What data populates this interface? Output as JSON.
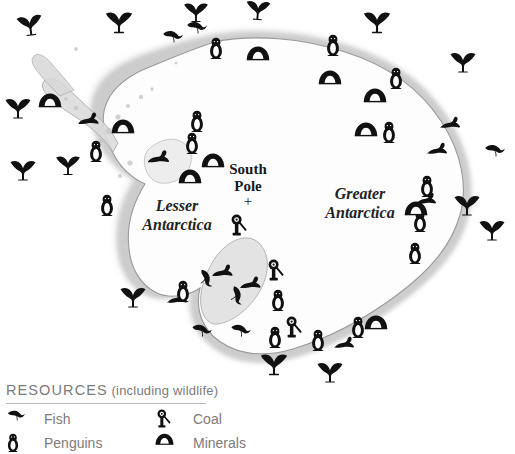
{
  "map": {
    "labels": [
      {
        "name": "lesser-antarctica-label",
        "text": "Lesser\nAntarctica",
        "x": 177,
        "y": 215
      },
      {
        "name": "greater-antarctica-label",
        "text": "Greater\nAntarctica",
        "x": 360,
        "y": 203
      }
    ],
    "south_pole": {
      "label": "South\nPole",
      "marker": "+",
      "x": 248,
      "y": 178,
      "marker_x": 248,
      "marker_y": 201
    },
    "continent_fill": "#fdfdfd",
    "shelf_fill": "#d5d5d5",
    "coast_stroke": "#9a9a9a",
    "icon_color": "#111111"
  },
  "legend": {
    "title_main": "RESOURCES",
    "title_sub": " (including wildlife)",
    "items": [
      {
        "name": "legend-fish",
        "icon": "fish-icon",
        "label": "Fish",
        "x": 6,
        "y": 28
      },
      {
        "name": "legend-penguins",
        "icon": "penguin-icon",
        "label": "Penguins",
        "x": 6,
        "y": 52
      },
      {
        "name": "legend-coal",
        "icon": "coal-icon",
        "label": "Coal",
        "x": 155,
        "y": 28
      },
      {
        "name": "legend-minerals",
        "icon": "minerals-icon",
        "label": "Minerals",
        "x": 155,
        "y": 52
      }
    ]
  },
  "icons": [
    {
      "name": "whale-icon",
      "type": "whale",
      "x": 30,
      "y": 25,
      "s": 1.0,
      "r": -8
    },
    {
      "name": "whale-icon",
      "type": "whale",
      "x": 119,
      "y": 22,
      "s": 1.05,
      "r": 0
    },
    {
      "name": "whale-icon",
      "type": "whale",
      "x": 196,
      "y": 12,
      "s": 0.95,
      "r": 0
    },
    {
      "name": "whale-icon",
      "type": "whale",
      "x": 258,
      "y": 10,
      "s": 0.95,
      "r": 4
    },
    {
      "name": "whale-icon",
      "type": "whale",
      "x": 377,
      "y": 22,
      "s": 1.05,
      "r": 0
    },
    {
      "name": "whale-icon",
      "type": "whale",
      "x": 18,
      "y": 108,
      "s": 1.0,
      "r": 0
    },
    {
      "name": "whale-icon",
      "type": "whale",
      "x": 23,
      "y": 170,
      "s": 1.0,
      "r": 0
    },
    {
      "name": "whale-icon",
      "type": "whale",
      "x": 68,
      "y": 165,
      "s": 0.95,
      "r": 0
    },
    {
      "name": "whale-icon",
      "type": "whale",
      "x": 133,
      "y": 297,
      "s": 1.0,
      "r": 0
    },
    {
      "name": "whale-icon",
      "type": "whale",
      "x": 274,
      "y": 364,
      "s": 1.05,
      "r": 0
    },
    {
      "name": "whale-icon",
      "type": "whale",
      "x": 330,
      "y": 372,
      "s": 1.0,
      "r": 0
    },
    {
      "name": "whale-icon",
      "type": "whale",
      "x": 467,
      "y": 205,
      "s": 1.0,
      "r": 0
    },
    {
      "name": "whale-icon",
      "type": "whale",
      "x": 492,
      "y": 230,
      "s": 1.0,
      "r": 0
    },
    {
      "name": "whale-icon",
      "type": "whale",
      "x": 463,
      "y": 62,
      "s": 1.0,
      "r": 0
    },
    {
      "name": "fish-icon",
      "type": "fish",
      "x": 172,
      "y": 36,
      "s": 1.0,
      "r": 0
    },
    {
      "name": "fish-icon",
      "type": "fish",
      "x": 196,
      "y": 27,
      "s": 1.0,
      "r": 0
    },
    {
      "name": "fish-icon",
      "type": "fish",
      "x": 205,
      "y": 278,
      "s": 1.0,
      "r": 55
    },
    {
      "name": "fish-icon",
      "type": "fish",
      "x": 236,
      "y": 295,
      "s": 1.0,
      "r": 65
    },
    {
      "name": "fish-icon",
      "type": "fish",
      "x": 201,
      "y": 330,
      "s": 1.0,
      "r": 5
    },
    {
      "name": "fish-icon",
      "type": "fish",
      "x": 240,
      "y": 330,
      "s": 1.0,
      "r": 5
    },
    {
      "name": "fish-icon",
      "type": "fish",
      "x": 494,
      "y": 150,
      "s": 1.0,
      "r": 0
    },
    {
      "name": "seal-icon",
      "type": "seal",
      "x": 88,
      "y": 118,
      "s": 1.0,
      "r": 0
    },
    {
      "name": "seal-icon",
      "type": "seal",
      "x": 158,
      "y": 156,
      "s": 1.05,
      "r": 0
    },
    {
      "name": "seal-icon",
      "type": "seal",
      "x": 222,
      "y": 270,
      "s": 1.0,
      "r": 0
    },
    {
      "name": "seal-icon",
      "type": "seal",
      "x": 250,
      "y": 282,
      "s": 1.0,
      "r": 0
    },
    {
      "name": "seal-icon",
      "type": "seal",
      "x": 177,
      "y": 297,
      "s": 0.95,
      "r": 0
    },
    {
      "name": "seal-icon",
      "type": "seal",
      "x": 344,
      "y": 342,
      "s": 0.95,
      "r": 0
    },
    {
      "name": "seal-icon",
      "type": "seal",
      "x": 426,
      "y": 198,
      "s": 0.95,
      "r": 0
    },
    {
      "name": "seal-icon",
      "type": "seal",
      "x": 437,
      "y": 148,
      "s": 0.95,
      "r": 0
    },
    {
      "name": "seal-icon",
      "type": "seal",
      "x": 450,
      "y": 122,
      "s": 0.95,
      "r": 0
    },
    {
      "name": "penguin-icon",
      "type": "penguin",
      "x": 96,
      "y": 151,
      "s": 1.0
    },
    {
      "name": "penguin-icon",
      "type": "penguin",
      "x": 107,
      "y": 205,
      "s": 1.0
    },
    {
      "name": "penguin-icon",
      "type": "penguin",
      "x": 197,
      "y": 121,
      "s": 1.0
    },
    {
      "name": "penguin-icon",
      "type": "penguin",
      "x": 192,
      "y": 143,
      "s": 1.0
    },
    {
      "name": "penguin-icon",
      "type": "penguin",
      "x": 216,
      "y": 48,
      "s": 1.0
    },
    {
      "name": "penguin-icon",
      "type": "penguin",
      "x": 333,
      "y": 45,
      "s": 1.0
    },
    {
      "name": "penguin-icon",
      "type": "penguin",
      "x": 396,
      "y": 78,
      "s": 1.0
    },
    {
      "name": "penguin-icon",
      "type": "penguin",
      "x": 389,
      "y": 132,
      "s": 1.0
    },
    {
      "name": "penguin-icon",
      "type": "penguin",
      "x": 427,
      "y": 186,
      "s": 1.0
    },
    {
      "name": "penguin-icon",
      "type": "penguin",
      "x": 420,
      "y": 221,
      "s": 1.0
    },
    {
      "name": "penguin-icon",
      "type": "penguin",
      "x": 415,
      "y": 253,
      "s": 1.0
    },
    {
      "name": "penguin-icon",
      "type": "penguin",
      "x": 183,
      "y": 291,
      "s": 1.0
    },
    {
      "name": "penguin-icon",
      "type": "penguin",
      "x": 278,
      "y": 300,
      "s": 1.0
    },
    {
      "name": "penguin-icon",
      "type": "penguin",
      "x": 275,
      "y": 337,
      "s": 1.0
    },
    {
      "name": "penguin-icon",
      "type": "penguin",
      "x": 318,
      "y": 340,
      "s": 1.0
    },
    {
      "name": "penguin-icon",
      "type": "penguin",
      "x": 358,
      "y": 327,
      "s": 1.0
    },
    {
      "name": "minerals-icon",
      "type": "minerals",
      "x": 50,
      "y": 100,
      "s": 1.0
    },
    {
      "name": "minerals-icon",
      "type": "minerals",
      "x": 123,
      "y": 126,
      "s": 1.0
    },
    {
      "name": "minerals-icon",
      "type": "minerals",
      "x": 213,
      "y": 160,
      "s": 1.0
    },
    {
      "name": "minerals-icon",
      "type": "minerals",
      "x": 190,
      "y": 176,
      "s": 1.0
    },
    {
      "name": "minerals-icon",
      "type": "minerals",
      "x": 258,
      "y": 53,
      "s": 1.0
    },
    {
      "name": "minerals-icon",
      "type": "minerals",
      "x": 330,
      "y": 77,
      "s": 1.0
    },
    {
      "name": "minerals-icon",
      "type": "minerals",
      "x": 375,
      "y": 95,
      "s": 1.0
    },
    {
      "name": "minerals-icon",
      "type": "minerals",
      "x": 366,
      "y": 129,
      "s": 1.0
    },
    {
      "name": "minerals-icon",
      "type": "minerals",
      "x": 416,
      "y": 208,
      "s": 1.0
    },
    {
      "name": "minerals-icon",
      "type": "minerals",
      "x": 376,
      "y": 322,
      "s": 1.0
    },
    {
      "name": "coal-icon",
      "type": "coal",
      "x": 238,
      "y": 225,
      "s": 1.0
    },
    {
      "name": "coal-icon",
      "type": "coal",
      "x": 275,
      "y": 270,
      "s": 1.0
    },
    {
      "name": "coal-icon",
      "type": "coal",
      "x": 293,
      "y": 327,
      "s": 1.0
    }
  ]
}
